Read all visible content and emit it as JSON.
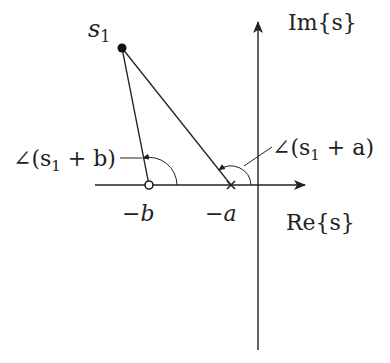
{
  "diagram": {
    "point_label": "s",
    "point_subscript": "1",
    "im_axis_label": "Im{s}",
    "re_axis_label": "Re{s}",
    "zero_label": "−b",
    "pole_label": "−a",
    "angle_b_label": "∠(s",
    "angle_b_sub": "1",
    "angle_b_tail": " + b)",
    "angle_a_label": "∠(s",
    "angle_a_sub": "1",
    "angle_a_tail": " + a)",
    "colors": {
      "ink": "#222222",
      "background": "#ffffff"
    }
  }
}
